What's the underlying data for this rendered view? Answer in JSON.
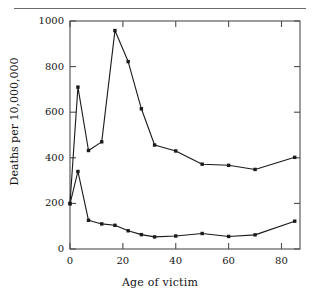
{
  "figure": {
    "background": "#ffffff",
    "line_color": "#1a1a1a",
    "frame_color": "#4d4d4d",
    "rule_color": "#6a6a6a"
  },
  "chart_data": {
    "type": "line",
    "title": "",
    "xlabel": "Age of victim",
    "ylabel": "Deaths per 10,000,000",
    "xlim": [
      0,
      87
    ],
    "ylim": [
      0,
      1000
    ],
    "xticks": [
      0,
      20,
      40,
      60,
      80
    ],
    "xticklabels": [
      "0",
      "20",
      "40",
      "60",
      "80"
    ],
    "yticks": [
      0,
      200,
      400,
      600,
      800,
      1000
    ],
    "yticklabels": [
      "0",
      "200",
      "400",
      "600",
      "800",
      "1000"
    ],
    "grid": false,
    "legend": "none",
    "marker": "filled-square",
    "series": [
      {
        "name": "upper-curve",
        "x": [
          0,
          3,
          7,
          12,
          17,
          22,
          27,
          32,
          40,
          50,
          60,
          70,
          85
        ],
        "y": [
          200,
          710,
          432,
          470,
          958,
          822,
          615,
          456,
          430,
          372,
          367,
          349,
          402
        ]
      },
      {
        "name": "lower-curve",
        "x": [
          0,
          3,
          7,
          12,
          17,
          22,
          27,
          32,
          40,
          50,
          60,
          70,
          85
        ],
        "y": [
          198,
          340,
          126,
          110,
          104,
          80,
          63,
          53,
          57,
          68,
          55,
          62,
          122
        ]
      }
    ]
  }
}
